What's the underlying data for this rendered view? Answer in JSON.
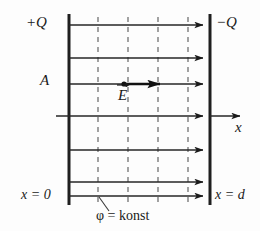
{
  "figure": {
    "labels": {
      "plus_charge": "+Q",
      "minus_charge": "−Q",
      "area": "A",
      "axis": "x",
      "x_left": "x = 0",
      "x_right": "x = d",
      "equipotential": "φ = konst",
      "field_vector": "E"
    },
    "colors": {
      "ink": "#1a1a1a",
      "line": "#2b2b2b",
      "dashed": "#6b6b6b",
      "background": "#fdfdfd"
    },
    "geometry": {
      "left_plate_x": 69,
      "right_plate_x": 210,
      "plate_top_y": 14,
      "plate_bottom_y": 205,
      "field_line_y": [
        25,
        58,
        84,
        116,
        150,
        182,
        196
      ],
      "equipotential_x": [
        98,
        128,
        158,
        188
      ],
      "field_line_count": 7,
      "equipotential_count": 4,
      "axis_row_index": 3,
      "e_vector_row_index": 2,
      "e_vector_start_x": 124,
      "e_vector_end_x": 168,
      "axis_arrow_end_x": 246,
      "axis_left_start_x": 56,
      "leader_from_x": 99,
      "leader_from_y": 198,
      "leader_to_x": 108,
      "leader_to_y": 210
    }
  }
}
